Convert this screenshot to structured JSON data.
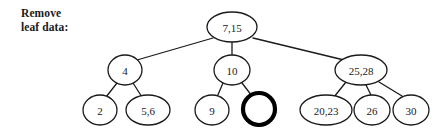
{
  "caption": {
    "text": "Remove\nleaf data:"
  },
  "colors": {
    "background": "#ffffff",
    "stroke": "#1a1a1a",
    "text": "#1a1a1a",
    "highlight_stroke": "#000000"
  },
  "diagram": {
    "type": "tree",
    "title": "Remove leaf data:",
    "node_stroke_width": 1.3,
    "highlight_stroke_width": 4.2,
    "nodes": [
      {
        "id": "root",
        "label": "7,15",
        "cx": 232,
        "cy": 27,
        "rx": 25,
        "ry": 15,
        "level": 0,
        "highlight": false,
        "empty": false
      },
      {
        "id": "n4",
        "label": "4",
        "cx": 125,
        "cy": 70,
        "rx": 17,
        "ry": 15,
        "level": 1,
        "highlight": false,
        "empty": false
      },
      {
        "id": "n10",
        "label": "10",
        "cx": 232,
        "cy": 70,
        "rx": 18,
        "ry": 15,
        "level": 1,
        "highlight": false,
        "empty": false
      },
      {
        "id": "n2528",
        "label": "25,28",
        "cx": 361,
        "cy": 70,
        "rx": 26,
        "ry": 15,
        "level": 1,
        "highlight": false,
        "empty": false
      },
      {
        "id": "l2",
        "label": "2",
        "cx": 100,
        "cy": 110,
        "rx": 17,
        "ry": 15,
        "level": 2,
        "highlight": false,
        "empty": false
      },
      {
        "id": "l56",
        "label": "5,6",
        "cx": 148,
        "cy": 110,
        "rx": 22,
        "ry": 15,
        "level": 2,
        "highlight": false,
        "empty": false
      },
      {
        "id": "l9",
        "label": "9",
        "cx": 212,
        "cy": 110,
        "rx": 17,
        "ry": 15,
        "level": 2,
        "highlight": false,
        "empty": false
      },
      {
        "id": "lempty",
        "label": "",
        "cx": 259,
        "cy": 109,
        "rx": 16,
        "ry": 16,
        "level": 2,
        "highlight": true,
        "empty": true
      },
      {
        "id": "l2023",
        "label": "20,23",
        "cx": 326,
        "cy": 110,
        "rx": 26,
        "ry": 15,
        "level": 2,
        "highlight": false,
        "empty": false
      },
      {
        "id": "l26",
        "label": "26",
        "cx": 372,
        "cy": 110,
        "rx": 18,
        "ry": 15,
        "level": 2,
        "highlight": false,
        "empty": false
      },
      {
        "id": "l30",
        "label": "30",
        "cx": 411,
        "cy": 110,
        "rx": 18,
        "ry": 15,
        "level": 2,
        "highlight": false,
        "empty": false
      }
    ],
    "edges": [
      {
        "from": "root",
        "to": "n4",
        "x1": 213,
        "y1": 38,
        "x2": 137,
        "y2": 60
      },
      {
        "from": "root",
        "to": "n10",
        "x1": 232,
        "y1": 42,
        "x2": 232,
        "y2": 55
      },
      {
        "from": "root",
        "to": "n2528",
        "x1": 253,
        "y1": 38,
        "x2": 344,
        "y2": 60
      },
      {
        "from": "n4",
        "to": "l2",
        "x1": 117,
        "y1": 83,
        "x2": 106,
        "y2": 97
      },
      {
        "from": "n4",
        "to": "l56",
        "x1": 133,
        "y1": 83,
        "x2": 142,
        "y2": 97
      },
      {
        "from": "n10",
        "to": "l9",
        "x1": 223,
        "y1": 83,
        "x2": 217,
        "y2": 97
      },
      {
        "from": "n10",
        "to": "lempty",
        "x1": 242,
        "y1": 83,
        "x2": 252,
        "y2": 96
      },
      {
        "from": "n2528",
        "to": "l2023",
        "x1": 346,
        "y1": 82,
        "x2": 334,
        "y2": 97
      },
      {
        "from": "n2528",
        "to": "l26",
        "x1": 366,
        "y1": 85,
        "x2": 371,
        "y2": 95
      },
      {
        "from": "n2528",
        "to": "l30",
        "x1": 379,
        "y1": 82,
        "x2": 402,
        "y2": 96
      }
    ]
  }
}
